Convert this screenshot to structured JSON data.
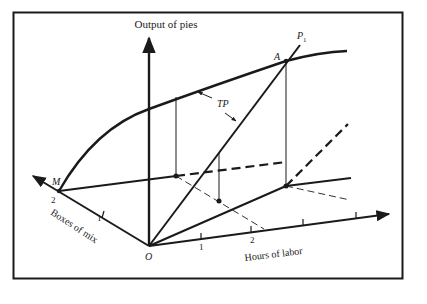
{
  "diagram": {
    "type": "3d-production-function",
    "axes": {
      "vertical": {
        "label": "Output of pies"
      },
      "left": {
        "label": "Boxes of mix",
        "ticks": [
          "1",
          "2"
        ]
      },
      "right": {
        "label": "Hours of labor",
        "ticks": [
          "1",
          "2"
        ]
      }
    },
    "labels": {
      "origin": "O",
      "point_m": "M",
      "point_a": "A",
      "ray": "P",
      "ray_subscript": "1",
      "curve": "TP"
    },
    "colors": {
      "ink": "#1a1a1a",
      "background": "#ffffff"
    }
  }
}
